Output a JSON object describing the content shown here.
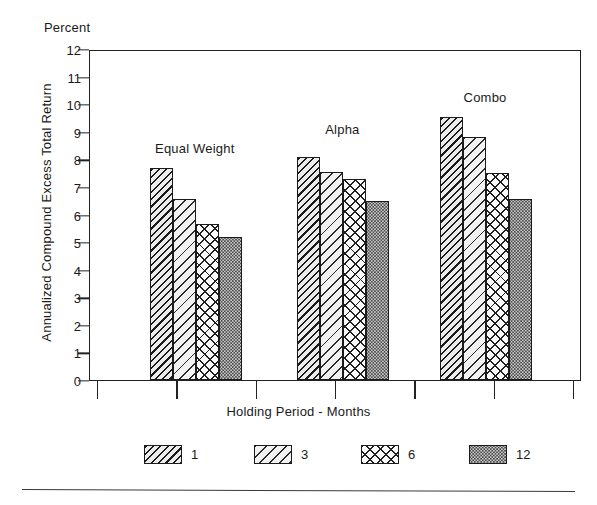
{
  "chart_data": {
    "type": "bar",
    "title": "",
    "unit_label": "Percent",
    "xlabel": "Holding Period - Months",
    "ylabel": "Annualized Compound Excess Total Return",
    "categories": [
      "Equal Weight",
      "Alpha",
      "Combo"
    ],
    "series": [
      {
        "name": "1",
        "values": [
          7.7,
          8.1,
          9.55
        ]
      },
      {
        "name": "3",
        "values": [
          6.55,
          7.55,
          8.8
        ]
      },
      {
        "name": "6",
        "values": [
          5.65,
          7.3,
          7.5
        ]
      },
      {
        "name": "12",
        "values": [
          5.2,
          6.5,
          6.55
        ]
      }
    ],
    "ylim": [
      0,
      12
    ],
    "yticks": [
      0,
      1,
      2,
      3,
      4,
      5,
      6,
      7,
      8,
      9,
      10,
      11,
      12
    ],
    "ytick_labels": [
      "0",
      "1",
      "2",
      "3",
      "4",
      "5",
      "6",
      "7",
      "8",
      "9",
      "10",
      "11",
      "12"
    ],
    "grid": false,
    "legend": {
      "position": "bottom",
      "entries": [
        {
          "label": "1",
          "pattern": "dense-diagonal-hatch"
        },
        {
          "label": "3",
          "pattern": "light-diagonal-hatch"
        },
        {
          "label": "6",
          "pattern": "diamond-crosshatch"
        },
        {
          "label": "12",
          "pattern": "dark-stipple"
        }
      ]
    },
    "group_labels": [
      "Equal Weight",
      "Alpha",
      "Combo"
    ],
    "x_tick_count": 7
  }
}
